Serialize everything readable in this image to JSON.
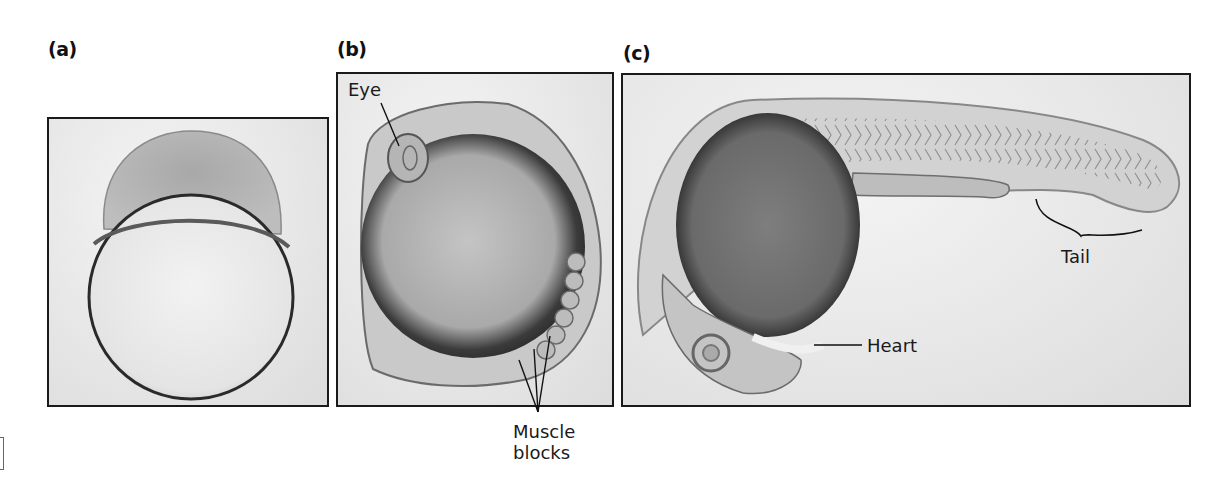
{
  "figure": {
    "panels": [
      {
        "id": "a",
        "label": "(a)",
        "subject": "zebrafish-embryo-early-cleavage"
      },
      {
        "id": "b",
        "label": "(b)",
        "subject": "zebrafish-embryo-segmentation"
      },
      {
        "id": "c",
        "label": "(c)",
        "subject": "zebrafish-embryo-pharyngula"
      }
    ],
    "annotations": {
      "eye": "Eye",
      "muscle_blocks_line1": "Muscle",
      "muscle_blocks_line2": "blocks",
      "heart": "Heart",
      "tail": "Tail"
    },
    "colors": {
      "frame_border": "#1a1a1a",
      "background": "#ffffff",
      "image_bg": "#e6e6e6",
      "yolk_dark": "#3a3a3a",
      "text": "#1a1a1a"
    }
  }
}
